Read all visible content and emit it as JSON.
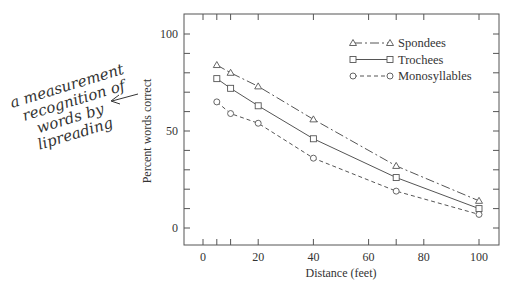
{
  "chart_data": {
    "type": "line",
    "title": "",
    "xlabel": "Distance (feet)",
    "ylabel": "Percent words correct",
    "xlim": [
      -8,
      108
    ],
    "ylim": [
      -10,
      110
    ],
    "x_ticks": [
      0,
      20,
      40,
      60,
      80,
      100
    ],
    "x_minor_ticks": [
      5,
      10,
      70
    ],
    "y_ticks": [
      0,
      50,
      100
    ],
    "y_minor_ticks": [
      10,
      20,
      30,
      40,
      60,
      70,
      80,
      90
    ],
    "grid": false,
    "legend_position": "top-right",
    "x": [
      5,
      10,
      20,
      40,
      70,
      100
    ],
    "series": [
      {
        "name": "Spondees",
        "marker": "triangle",
        "line": "dash-dot",
        "values": [
          84,
          80,
          73,
          56,
          32,
          14
        ]
      },
      {
        "name": "Trochees",
        "marker": "square",
        "line": "solid",
        "values": [
          77,
          72,
          63,
          46,
          26,
          10
        ]
      },
      {
        "name": "Monosyllables",
        "marker": "circle",
        "line": "dashed",
        "values": [
          65,
          59,
          54,
          36,
          19,
          7
        ]
      }
    ],
    "annotations": [
      {
        "text_lines": [
          "a measurement",
          "recognition of",
          "words by",
          "lipreading"
        ],
        "style": "handwritten",
        "arrow": "points-to-y-axis-label"
      }
    ]
  }
}
